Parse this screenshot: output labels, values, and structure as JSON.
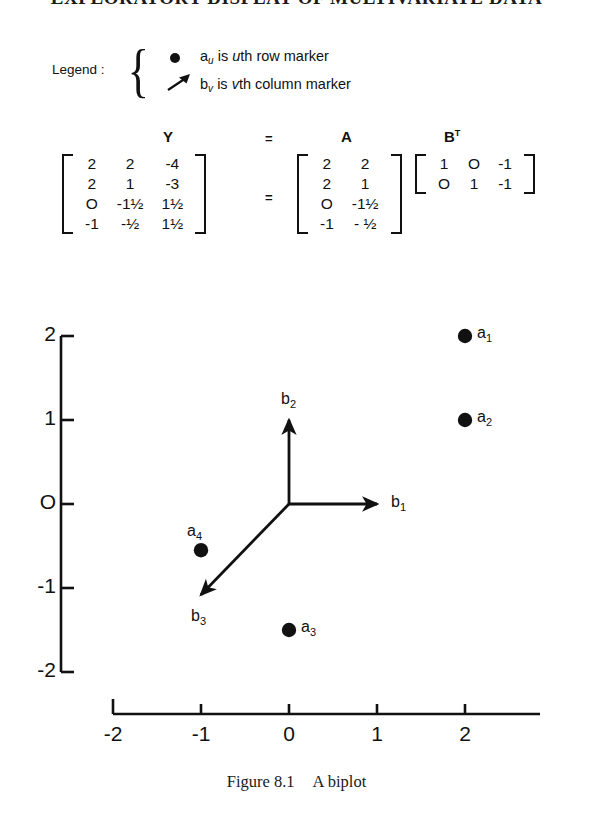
{
  "running_head": "EXPLORATORY DISPLAY OF MULTIVARIATE DATA",
  "legend": {
    "title": "Legend :",
    "rows": [
      {
        "glyph": "filled-dot",
        "symbol": "a",
        "subscript": "u",
        "text_italic": "u",
        "text": "th row marker"
      },
      {
        "glyph": "arrow",
        "symbol": "b",
        "subscript": "v",
        "text_italic": "v",
        "text": "th column marker"
      }
    ]
  },
  "equation": {
    "label_Y": "Y",
    "label_eq_top": "=",
    "label_A": "A",
    "label_B": "B",
    "label_B_sup": "T",
    "eq_sign": "=",
    "Y": [
      [
        "2",
        "2",
        "-4"
      ],
      [
        "2",
        "1",
        "-3"
      ],
      [
        "O",
        "-1½",
        "1½"
      ],
      [
        "-1",
        "-½",
        "1½"
      ]
    ],
    "A": [
      [
        "2",
        "2"
      ],
      [
        "2",
        "1"
      ],
      [
        "O",
        "-1½"
      ],
      [
        "-1",
        "- ½"
      ]
    ],
    "BT": [
      [
        "1",
        "O",
        "-1"
      ],
      [
        "O",
        "1",
        "-1"
      ]
    ]
  },
  "caption": {
    "figure_number": "Figure 8.1",
    "title": "A biplot"
  },
  "chart_data": {
    "type": "scatter",
    "title": "A biplot",
    "xlabel": "",
    "ylabel": "",
    "xlim": [
      -2.2,
      2.6
    ],
    "ylim": [
      -2.2,
      2.3
    ],
    "xticks": [
      "-2",
      "-1",
      "0",
      "1",
      "2"
    ],
    "xtick_values": [
      -2,
      -1,
      0,
      1,
      2
    ],
    "yticks": [
      "2",
      "1",
      "O",
      "-1",
      "-2"
    ],
    "ytick_values": [
      2,
      1,
      0,
      -1,
      -2
    ],
    "grid": false,
    "legend_position": "above-plot",
    "row_markers": [
      {
        "label": "a",
        "sub": "1",
        "x": 2.0,
        "y": 2.0
      },
      {
        "label": "a",
        "sub": "2",
        "x": 2.0,
        "y": 1.0
      },
      {
        "label": "a",
        "sub": "3",
        "x": 0.0,
        "y": -1.5
      },
      {
        "label": "a",
        "sub": "4",
        "x": -1.0,
        "y": -0.55
      }
    ],
    "column_markers": [
      {
        "label": "b",
        "sub": "1",
        "x": 1.0,
        "y": 0.0
      },
      {
        "label": "b",
        "sub": "2",
        "x": 0.0,
        "y": 1.0
      },
      {
        "label": "b",
        "sub": "3",
        "x": -1.0,
        "y": -1.08
      }
    ],
    "vector_origin": {
      "x": 0.0,
      "y": 0.0
    }
  }
}
